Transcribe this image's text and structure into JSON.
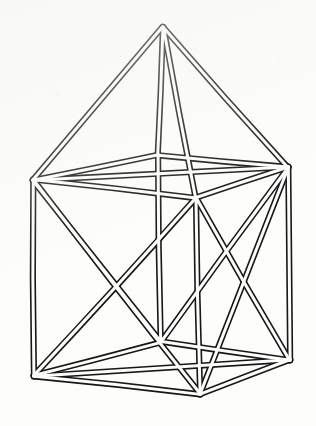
{
  "figure": {
    "background_color": "#fdfdfb",
    "stroke_color": "#171717",
    "fill_color": "#fdfdfb",
    "canvas": {
      "width": 316,
      "height": 426
    },
    "style": {
      "render": "double-line-strut",
      "outer_stroke_width": 6.2,
      "inner_stroke_width": 3.0,
      "line_cap": "round"
    },
    "vertices": {
      "apex": {
        "label": "apex",
        "x": 163,
        "y": 27
      },
      "top_left": {
        "label": "top-left",
        "x": 33,
        "y": 180
      },
      "top_back": {
        "label": "top-back",
        "x": 158,
        "y": 155
      },
      "top_right": {
        "label": "top-right",
        "x": 288,
        "y": 167
      },
      "top_front": {
        "label": "top-front",
        "x": 196,
        "y": 198
      },
      "bot_left": {
        "label": "bottom-left",
        "x": 34,
        "y": 376
      },
      "bot_back": {
        "label": "bottom-back",
        "x": 161,
        "y": 342
      },
      "bot_right": {
        "label": "bottom-right",
        "x": 290,
        "y": 360
      },
      "bot_front": {
        "label": "bottom-front",
        "x": 200,
        "y": 394
      }
    },
    "edges": {
      "pyramid": [
        {
          "name": "apex-to-top-left",
          "from": "apex",
          "to": "top_left"
        },
        {
          "name": "apex-to-top-back",
          "from": "apex",
          "to": "top_back"
        },
        {
          "name": "apex-to-top-right",
          "from": "apex",
          "to": "top_right"
        },
        {
          "name": "apex-to-top-front",
          "from": "apex",
          "to": "top_front"
        }
      ],
      "top_rim": [
        {
          "name": "top-left-to-top-back",
          "from": "top_left",
          "to": "top_back"
        },
        {
          "name": "top-back-to-top-right",
          "from": "top_back",
          "to": "top_right"
        },
        {
          "name": "top-right-to-top-front",
          "from": "top_right",
          "to": "top_front"
        },
        {
          "name": "top-front-to-top-left",
          "from": "top_front",
          "to": "top_left"
        }
      ],
      "verticals": [
        {
          "name": "post-left",
          "from": "top_left",
          "to": "bot_left"
        },
        {
          "name": "post-back",
          "from": "top_back",
          "to": "bot_back"
        },
        {
          "name": "post-right",
          "from": "top_right",
          "to": "bot_right"
        },
        {
          "name": "post-front",
          "from": "top_front",
          "to": "bot_front"
        }
      ],
      "bottom_rim": [
        {
          "name": "bottom-left-to-bottom-back",
          "from": "bot_left",
          "to": "bot_back"
        },
        {
          "name": "bottom-back-to-bottom-right",
          "from": "bot_back",
          "to": "bot_right"
        },
        {
          "name": "bottom-right-to-bottom-front",
          "from": "bot_right",
          "to": "bot_front"
        },
        {
          "name": "bottom-front-to-bottom-left",
          "from": "bot_front",
          "to": "bot_left"
        }
      ],
      "bracing": [
        {
          "name": "brace-left-face-a",
          "from": "top_left",
          "to": "bot_front"
        },
        {
          "name": "brace-left-face-b",
          "from": "bot_left",
          "to": "top_front"
        },
        {
          "name": "brace-right-face-a",
          "from": "top_front",
          "to": "bot_right"
        },
        {
          "name": "brace-right-face-b",
          "from": "bot_front",
          "to": "top_right"
        },
        {
          "name": "brace-back-left-face",
          "from": "top_left",
          "to": "bot_back"
        },
        {
          "name": "brace-back-right-face",
          "from": "top_right",
          "to": "bot_back"
        },
        {
          "name": "brace-top-rim-a",
          "from": "top_left",
          "to": "top_right"
        },
        {
          "name": "brace-base-a",
          "from": "bot_left",
          "to": "bot_right"
        }
      ]
    }
  }
}
